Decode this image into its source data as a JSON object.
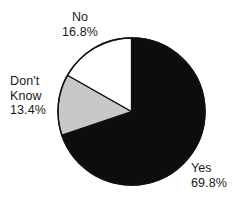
{
  "chart_data": {
    "type": "pie",
    "title": "",
    "subtitle": "",
    "xlabel": "",
    "ylabel": "",
    "legend_position": "none",
    "grid": false,
    "start_angle_deg": 0,
    "direction": "clockwise",
    "categories": [
      "Yes",
      "Don't Know",
      "No"
    ],
    "values": [
      69.8,
      13.4,
      16.8
    ],
    "value_unit": "%",
    "slices": [
      {
        "label": "Yes",
        "value": 69.8,
        "value_text": "69.8%",
        "color": "#0d0d0d",
        "start_deg": 0,
        "end_deg": 251.3
      },
      {
        "label": "Don't Know",
        "value": 13.4,
        "value_text": "13.4%",
        "color": "#c8c8c8",
        "start_deg": 251.3,
        "end_deg": 299.5
      },
      {
        "label": "No",
        "value": 16.8,
        "value_text": "16.8%",
        "color": "#ffffff",
        "start_deg": 299.5,
        "end_deg": 360
      }
    ],
    "annotations": [
      {
        "name": "no-label",
        "lines": [
          "No",
          "16.8%"
        ]
      },
      {
        "name": "dont-know-label",
        "lines": [
          "Don't",
          "Know",
          "13.4%"
        ]
      },
      {
        "name": "yes-label",
        "lines": [
          "Yes",
          "69.8%"
        ]
      }
    ]
  },
  "labels": {
    "no": {
      "name": "No",
      "line1": "No",
      "line2": "16.8%"
    },
    "dont_know": {
      "name": "Don't Know",
      "line1": "Don't",
      "line2": "Know",
      "line3": "13.4%"
    },
    "yes": {
      "name": "Yes",
      "line1": "Yes",
      "line2": "69.8%"
    }
  },
  "colors": {
    "background": "#ffffff",
    "outline": "#111111",
    "slice_yes": "#0d0d0d",
    "slice_dont_know": "#c8c8c8",
    "slice_no": "#ffffff",
    "text": "#1a1a1a"
  }
}
